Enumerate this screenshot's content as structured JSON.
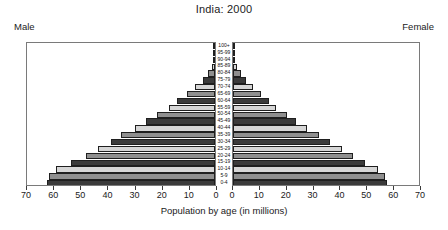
{
  "chart_data": {
    "type": "bar",
    "subtype": "population-pyramid",
    "title": "India: 2000",
    "xlabel": "Population by age (in millions)",
    "ylabel": "",
    "grid": false,
    "legend_position": "none",
    "left_label": "Male",
    "right_label": "Female",
    "xlim_left": [
      70,
      0
    ],
    "xlim_right": [
      0,
      70
    ],
    "xticks_left": [
      70,
      60,
      50,
      40,
      30,
      20,
      10,
      0
    ],
    "xticks_right": [
      0,
      10,
      20,
      30,
      40,
      50,
      60,
      70
    ],
    "categories": [
      "0-4",
      "5-9",
      "10-14",
      "15-19",
      "20-24",
      "25-29",
      "30-34",
      "35-39",
      "40-44",
      "45-49",
      "50-54",
      "55-59",
      "60-64",
      "65-69",
      "70-74",
      "75-79",
      "80-84",
      "85-89",
      "90-94",
      "95-99",
      "100+"
    ],
    "series": [
      {
        "name": "Male",
        "values": [
          62.0,
          61.0,
          58.5,
          53.0,
          47.5,
          43.0,
          38.5,
          34.5,
          29.5,
          25.5,
          21.5,
          17.0,
          14.0,
          10.5,
          7.5,
          4.5,
          2.5,
          1.2,
          0.5,
          0.2,
          0.1
        ]
      },
      {
        "name": "Female",
        "values": [
          57.5,
          56.5,
          54.0,
          49.0,
          44.5,
          40.5,
          36.0,
          32.0,
          27.5,
          23.5,
          20.0,
          16.0,
          13.5,
          10.5,
          7.5,
          4.8,
          2.8,
          1.4,
          0.6,
          0.2,
          0.1
        ]
      }
    ],
    "bar_shades": [
      "#3b3b3b",
      "#8f8f8f",
      "#d6d6d6"
    ]
  }
}
